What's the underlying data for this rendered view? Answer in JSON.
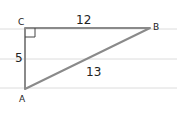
{
  "diagram": {
    "vertices": {
      "A": {
        "label": "A",
        "x": 25,
        "y": 89
      },
      "B": {
        "label": "B",
        "x": 150,
        "y": 28
      },
      "C": {
        "label": "C",
        "x": 25,
        "y": 28
      }
    },
    "sides": {
      "CB": {
        "label": "12"
      },
      "CA": {
        "label": "5"
      },
      "AB": {
        "label": "13"
      }
    },
    "right_angle_at": "C",
    "ruled_lines_y": [
      28,
      58,
      88
    ],
    "colors": {
      "triangle_stroke": "#8a8a8a",
      "ruled_line": "#d8d8d8",
      "text": "#222222"
    }
  }
}
